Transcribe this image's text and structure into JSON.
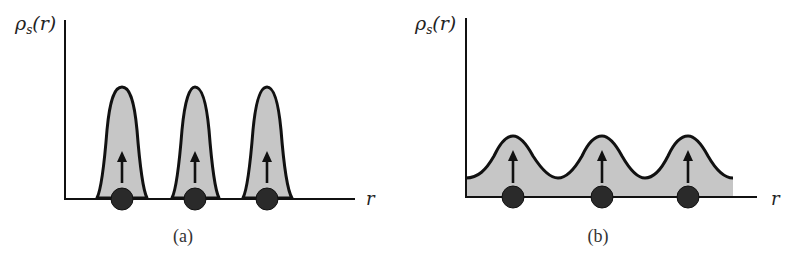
{
  "figure": {
    "panels": [
      {
        "id": "a",
        "label": "(a)",
        "y_axis_label_main": "ρ",
        "y_axis_label_sub": "s",
        "y_axis_label_arg": "(r)",
        "x_axis_label": "r",
        "description": "Localized spin density: three tall narrow peaks, each centered on an atom with an up-pointing spin arrow; density drops to zero between atoms",
        "atoms": 3,
        "spin_direction": "up"
      },
      {
        "id": "b",
        "label": "(b)",
        "y_axis_label_main": "ρ",
        "y_axis_label_sub": "s",
        "y_axis_label_arg": "(r)",
        "x_axis_label": "r",
        "description": "Itinerant spin density: low-amplitude wave with three broad maxima over atoms, each with an up-pointing spin arrow; nonzero density between atoms",
        "atoms": 3,
        "spin_direction": "up"
      }
    ],
    "caption_text": "",
    "colors": {
      "fill": "#c6c6c6",
      "line": "#111111",
      "atom": "#2a2a2a",
      "axis": "#111111"
    }
  }
}
